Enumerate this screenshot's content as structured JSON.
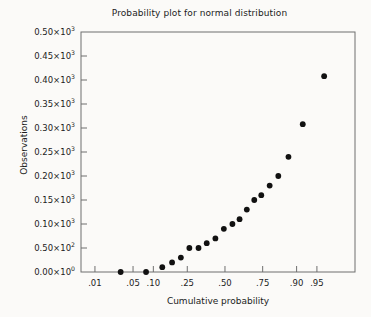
{
  "chart_data": {
    "type": "scatter",
    "title": "Probability plot for normal distribution",
    "xlabel": "Cumulative probability",
    "ylabel": "Observations",
    "grid": false,
    "legend": null,
    "xscale": "probit",
    "yscale": "linear",
    "xlim": [
      0.005,
      0.99
    ],
    "ylim": [
      0,
      500
    ],
    "xticks": [
      0.01,
      0.05,
      0.1,
      0.25,
      0.5,
      0.75,
      0.9,
      0.95
    ],
    "xticklabels": [
      ".01",
      ".05",
      ".10",
      ".25",
      ".50",
      ".75",
      ".90",
      ".95"
    ],
    "yticks": [
      0,
      50,
      100,
      150,
      200,
      250,
      300,
      350,
      400,
      450,
      500
    ],
    "yticklabels": [
      {
        "mantissa": "0.00",
        "exp": "0"
      },
      {
        "mantissa": "0.50",
        "exp": "2"
      },
      {
        "mantissa": "0.10",
        "exp": "3"
      },
      {
        "mantissa": "0.15",
        "exp": "3"
      },
      {
        "mantissa": "0.20",
        "exp": "3"
      },
      {
        "mantissa": "0.25",
        "exp": "3"
      },
      {
        "mantissa": "0.30",
        "exp": "3"
      },
      {
        "mantissa": "0.35",
        "exp": "3"
      },
      {
        "mantissa": "0.40",
        "exp": "3"
      },
      {
        "mantissa": "0.45",
        "exp": "3"
      },
      {
        "mantissa": "0.50",
        "exp": "3"
      }
    ],
    "marker": "circle",
    "marker_color": "#111111",
    "marker_size": 4.2,
    "points": [
      {
        "x": 0.031,
        "y": 0
      },
      {
        "x": 0.079,
        "y": 0
      },
      {
        "x": 0.131,
        "y": 10
      },
      {
        "x": 0.172,
        "y": 20
      },
      {
        "x": 0.215,
        "y": 30
      },
      {
        "x": 0.262,
        "y": 50
      },
      {
        "x": 0.318,
        "y": 50
      },
      {
        "x": 0.372,
        "y": 60
      },
      {
        "x": 0.432,
        "y": 70
      },
      {
        "x": 0.492,
        "y": 90
      },
      {
        "x": 0.553,
        "y": 100
      },
      {
        "x": 0.603,
        "y": 110
      },
      {
        "x": 0.652,
        "y": 130
      },
      {
        "x": 0.7,
        "y": 150
      },
      {
        "x": 0.742,
        "y": 160
      },
      {
        "x": 0.788,
        "y": 180
      },
      {
        "x": 0.83,
        "y": 200
      },
      {
        "x": 0.872,
        "y": 240
      },
      {
        "x": 0.918,
        "y": 308
      },
      {
        "x": 0.962,
        "y": 408
      }
    ]
  },
  "colors": {
    "background": "#fbfaf8",
    "axis": "#6f6f6f",
    "text": "#1c1c1c",
    "marker": "#111111"
  }
}
